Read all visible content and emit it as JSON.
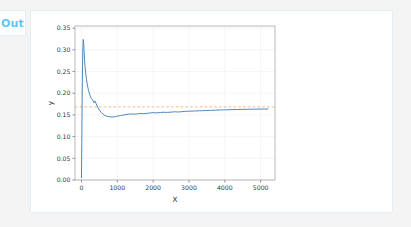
{
  "cell": {
    "prompt_label": "Out",
    "prompt_color": "#5ec8f5"
  },
  "chart_data": {
    "type": "line",
    "title": "",
    "xlabel": "X",
    "ylabel": "y",
    "xlim": [
      -180,
      5400
    ],
    "ylim": [
      0.0,
      0.355
    ],
    "xticks": [
      0,
      1000,
      2000,
      3000,
      4000,
      5000
    ],
    "xtick_labels": [
      "0",
      "1000",
      "2000",
      "3000",
      "4000",
      "5000"
    ],
    "yticks": [
      0.0,
      0.05,
      0.1,
      0.15,
      0.2,
      0.25,
      0.3,
      0.35
    ],
    "ytick_labels": [
      "0.00",
      "0.05",
      "0.10",
      "0.15",
      "0.20",
      "0.25",
      "0.30",
      "0.35"
    ],
    "grid": true,
    "grid_color": "#f0f0f0",
    "legend": "none",
    "series": [
      {
        "name": "y",
        "type": "line",
        "color": "#3b7bb5",
        "linestyle": "solid",
        "linewidth": 0.9,
        "x": [
          0,
          10,
          20,
          30,
          40,
          50,
          60,
          70,
          80,
          90,
          100,
          120,
          140,
          160,
          180,
          200,
          230,
          260,
          290,
          320,
          350,
          380,
          410,
          450,
          500,
          550,
          600,
          650,
          700,
          760,
          820,
          880,
          950,
          1020,
          1090,
          1160,
          1240,
          1320,
          1400,
          1480,
          1560,
          1640,
          1720,
          1800,
          1900,
          2000,
          2100,
          2200,
          2300,
          2400,
          2500,
          2600,
          2700,
          2800,
          2900,
          3000,
          3150,
          3300,
          3450,
          3600,
          3750,
          3900,
          4050,
          4200,
          4350,
          4500,
          4650,
          4800,
          4950,
          5100,
          5200
        ],
        "y": [
          0.005,
          0.082,
          0.186,
          0.262,
          0.305,
          0.324,
          0.318,
          0.302,
          0.286,
          0.272,
          0.262,
          0.245,
          0.232,
          0.221,
          0.213,
          0.206,
          0.197,
          0.19,
          0.186,
          0.184,
          0.178,
          0.182,
          0.176,
          0.168,
          0.161,
          0.156,
          0.152,
          0.149,
          0.147,
          0.146,
          0.1455,
          0.1452,
          0.146,
          0.1475,
          0.1485,
          0.1495,
          0.151,
          0.1518,
          0.1522,
          0.1518,
          0.1525,
          0.1535,
          0.1528,
          0.1532,
          0.1545,
          0.1552,
          0.1548,
          0.1556,
          0.1562,
          0.1558,
          0.1565,
          0.1572,
          0.1568,
          0.1575,
          0.1582,
          0.1586,
          0.159,
          0.1596,
          0.16,
          0.1605,
          0.161,
          0.1615,
          0.1618,
          0.1622,
          0.1625,
          0.1628,
          0.163,
          0.1632,
          0.1634,
          0.1636,
          0.1637
        ]
      },
      {
        "name": "reference",
        "type": "hline",
        "color": "#e8a97a",
        "linestyle": "dashed",
        "linewidth": 0.8,
        "value": 0.1685
      }
    ]
  }
}
